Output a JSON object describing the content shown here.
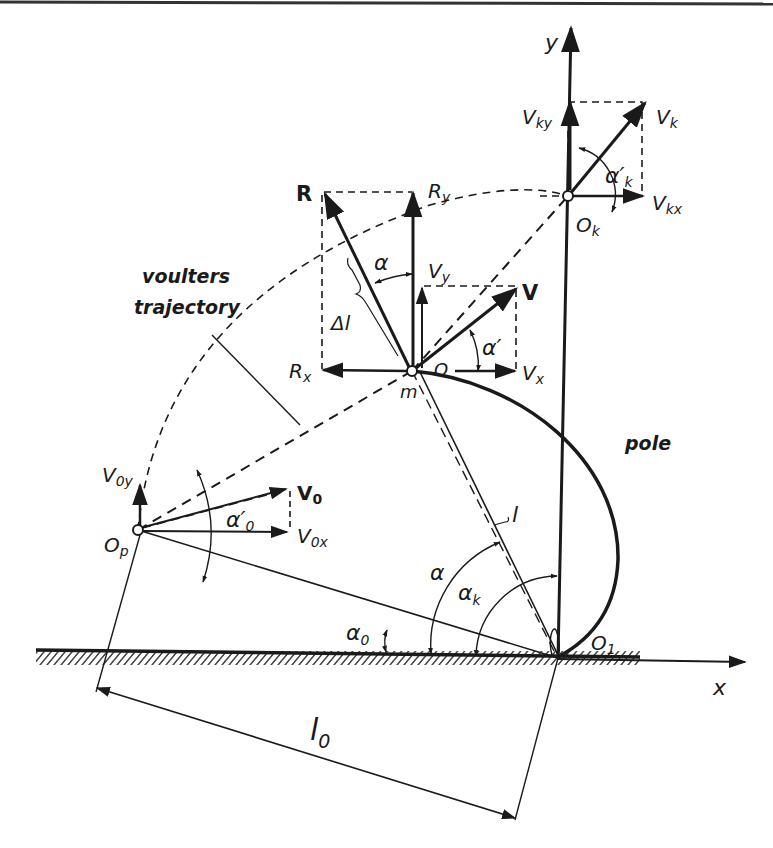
{
  "figure": {
    "type": "pole-vault mechanics diagram",
    "colors": {
      "ink": "#1a1a1a",
      "background": "#ffffff"
    }
  },
  "axes": {
    "x_label": "x",
    "y_label": "y"
  },
  "points": {
    "Op": "O",
    "Op_sub": "p",
    "m": "m",
    "O": "O",
    "Ok": "O",
    "Ok_sub": "k",
    "O1": "O",
    "O1_sub": "1"
  },
  "vectors": {
    "R": "R",
    "Rx": "R",
    "Rx_sub": "x",
    "Ry": "R",
    "Ry_sub": "y",
    "V": "V",
    "Vx": "V",
    "Vx_sub": "x",
    "Vy": "V",
    "Vy_sub": "y",
    "V0": "V",
    "V0_sub": "0",
    "V0x": "V",
    "V0x_sub": "0x",
    "V0y": "V",
    "V0y_sub": "0y",
    "Vk": "V",
    "Vk_sub": "k",
    "Vkx": "V",
    "Vkx_sub": "kx",
    "Vky": "V",
    "Vky_sub": "ky"
  },
  "angles": {
    "alpha": "α",
    "alpha_prime": "α′",
    "alpha0_prime": "α′",
    "alpha0_prime_sub": "0",
    "alphak_prime": "α′",
    "alphak_prime_sub": "k",
    "alpha0": "α",
    "alpha0_sub": "0",
    "alphak": "α",
    "alphak_sub": "k",
    "alpha_ground": "α"
  },
  "lengths": {
    "l": "l",
    "delta_l": "Δl",
    "l0": "l",
    "l0_sub": "0"
  },
  "annotations": {
    "trajectory_line1": "voulters",
    "trajectory_line2": "trajectory",
    "pole": "pole"
  }
}
